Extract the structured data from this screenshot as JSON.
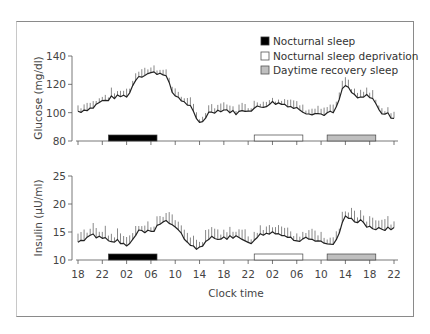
{
  "chart_data": [
    {
      "type": "line",
      "title": "",
      "ylabel": "Glucose (mg/dl)",
      "xlabel": "",
      "ylim": [
        80,
        140
      ],
      "yticks": [
        80,
        100,
        120,
        140
      ],
      "x_tick_labels": [
        "18",
        "22",
        "02",
        "06",
        "10",
        "14",
        "18",
        "22",
        "02",
        "06",
        "10",
        "14",
        "18",
        "22"
      ],
      "x_hours_from_18": [
        0,
        2,
        4,
        6,
        8,
        10,
        12,
        14,
        16,
        18,
        20,
        22,
        24,
        26,
        28,
        30,
        32,
        34,
        36,
        38,
        40,
        42,
        44,
        46,
        48,
        50,
        52
      ],
      "series": [
        {
          "name": "Glucose",
          "values": [
            101,
            103,
            108,
            111,
            112,
            126,
            128,
            128,
            112,
            106,
            93,
            101,
            102,
            100,
            102,
            104,
            107,
            106,
            103,
            100,
            99,
            100,
            119,
            110,
            112,
            100,
            97
          ]
        }
      ],
      "sleep_bars": [
        {
          "label": "Nocturnal sleep",
          "start_h": 5,
          "end_h": 13,
          "fill": "#000000"
        },
        {
          "label": "Nocturnal sleep deprivation",
          "start_h": 29,
          "end_h": 37,
          "fill": "#ffffff"
        },
        {
          "label": "Daytime recovery sleep",
          "start_h": 41,
          "end_h": 49,
          "fill": "#bfbfbf"
        }
      ]
    },
    {
      "type": "line",
      "title": "",
      "ylabel": "Insulin (µU/ml)",
      "xlabel": "Clock time",
      "ylim": [
        10,
        25
      ],
      "yticks": [
        10,
        15,
        20,
        25
      ],
      "x_tick_labels": [
        "18",
        "22",
        "02",
        "06",
        "10",
        "14",
        "18",
        "22",
        "02",
        "06",
        "10",
        "14",
        "18",
        "22"
      ],
      "x_hours_from_18": [
        0,
        2,
        4,
        6,
        8,
        10,
        12,
        14,
        16,
        18,
        20,
        22,
        24,
        26,
        28,
        30,
        32,
        34,
        36,
        38,
        40,
        42,
        44,
        46,
        48,
        50,
        52
      ],
      "series": [
        {
          "name": "Insulin",
          "values": [
            13,
            14.5,
            14,
            13.5,
            12.5,
            15,
            15,
            17,
            16,
            13,
            12,
            14,
            14,
            14,
            13,
            14.5,
            15,
            14.5,
            13.5,
            14,
            13,
            12.5,
            17.5,
            17,
            16,
            15.5,
            15.5
          ]
        }
      ],
      "sleep_bars": [
        {
          "label": "Nocturnal sleep",
          "start_h": 5,
          "end_h": 13,
          "fill": "#000000"
        },
        {
          "label": "Nocturnal sleep deprivation",
          "start_h": 29,
          "end_h": 37,
          "fill": "#ffffff"
        },
        {
          "label": "Daytime recovery sleep",
          "start_h": 41,
          "end_h": 49,
          "fill": "#bfbfbf"
        }
      ]
    }
  ],
  "legend": {
    "items": [
      {
        "label": "Nocturnal sleep",
        "fill": "#000000"
      },
      {
        "label": "Nocturnal sleep deprivation",
        "fill": "#ffffff"
      },
      {
        "label": "Daytime recovery sleep",
        "fill": "#bfbfbf"
      }
    ]
  },
  "axes": {
    "glucose_title": "Glucose (mg/dl)",
    "insulin_title": "Insulin (µU/ml)",
    "x_title": "Clock time"
  },
  "colors": {
    "trace": "#222222",
    "spike": "#7a7a7a",
    "axis": "#555555"
  }
}
